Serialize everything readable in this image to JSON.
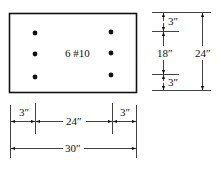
{
  "section": {
    "label": "6 #10",
    "bar_count": 6,
    "bars_per_side": 3
  },
  "dimensions": {
    "vertical": {
      "top_cover": "3″",
      "middle": "18″",
      "bottom_cover": "3″",
      "total": "24″"
    },
    "horizontal": {
      "left_cover": "3″",
      "middle": "24″",
      "right_cover": "3″",
      "total": "30″"
    }
  },
  "colors": {
    "ink": "#111111",
    "background": "#ffffff"
  }
}
